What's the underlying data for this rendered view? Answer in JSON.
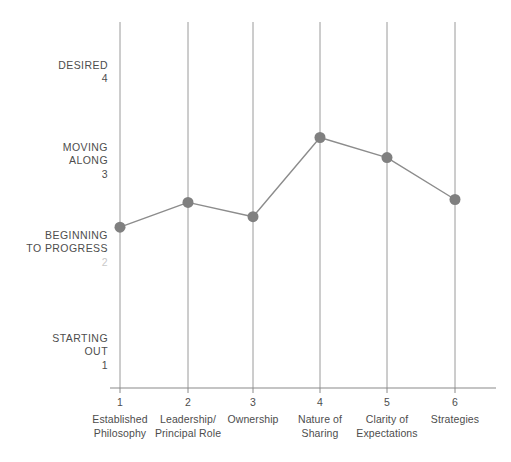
{
  "chart_data": {
    "type": "line",
    "title": "",
    "subtitle": "",
    "xlabel": "",
    "ylabel": "",
    "grid": "vertical-only",
    "legend": "none",
    "xlim": [
      0.5,
      6.5
    ],
    "ylim": [
      1,
      4
    ],
    "x": [
      1,
      2,
      3,
      4,
      5,
      6
    ],
    "categories": [
      "Established\nPhilosophy",
      "Leadership/\nPrincipal Role",
      "Ownership",
      "Nature of\nSharing",
      "Clarity of\nExpectations",
      "Strategies"
    ],
    "xtick_labels": [
      "1",
      "2",
      "3",
      "4",
      "5",
      "6"
    ],
    "values": [
      2.32,
      2.58,
      2.43,
      3.26,
      3.05,
      2.61
    ],
    "ytick_values": [
      1,
      2,
      3,
      4
    ],
    "ytick_labels": [
      {
        "text": "STARTING\nOUT",
        "number": "1",
        "value": 1,
        "faint": false
      },
      {
        "text": "BEGINNING\nTO PROGRESS",
        "number": "2",
        "value": 2,
        "faint": true
      },
      {
        "text": "MOVING\nALONG",
        "number": "3",
        "value": 3,
        "faint": false
      },
      {
        "text": "DESIRED",
        "number": "4",
        "value": 4,
        "faint": false
      }
    ],
    "colors": {
      "marker": "#808080",
      "line": "#8c8c8c",
      "gridline": "#9a9a9a",
      "axis": "#8a8a8a",
      "text": "#4d4d4d",
      "faint_text": "#c9c9c9",
      "background": "#ffffff"
    },
    "marker": {
      "shape": "circle",
      "radius": 5.5
    }
  },
  "yaxis": {
    "labels": [
      {
        "text": "DESIRED",
        "number": "4"
      },
      {
        "text": "MOVING\nALONG",
        "number": "3"
      },
      {
        "text": "BEGINNING\nTO PROGRESS",
        "number": "2"
      },
      {
        "text": "STARTING\nOUT",
        "number": "1"
      }
    ]
  },
  "xaxis": {
    "ticks": [
      {
        "number": "1",
        "label": "Established\nPhilosophy"
      },
      {
        "number": "2",
        "label": "Leadership/\nPrincipal Role"
      },
      {
        "number": "3",
        "label": "Ownership"
      },
      {
        "number": "4",
        "label": "Nature of\nSharing"
      },
      {
        "number": "5",
        "label": "Clarity of\nExpectations"
      },
      {
        "number": "6",
        "label": "Strategies"
      }
    ]
  }
}
